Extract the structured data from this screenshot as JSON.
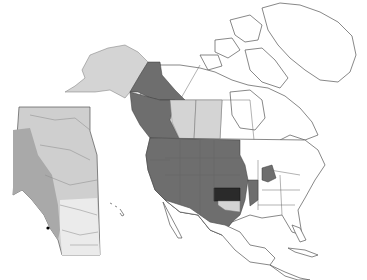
{
  "map": {
    "title": "",
    "region": "North America",
    "legend_colors": {
      "primary_range": "#6e6e6e",
      "secondary_range": "#d4d4d4",
      "focus_area": "#2a2a2a",
      "land": "#ffffff",
      "outline": "#555555"
    },
    "shaded_regions": {
      "primary_range": [
        "British Columbia",
        "Yukon",
        "Washington",
        "Oregon",
        "California",
        "Idaho",
        "Montana",
        "Wyoming",
        "Nevada",
        "Utah",
        "Colorado",
        "Arizona",
        "New Mexico",
        "North Dakota",
        "South Dakota",
        "Nebraska",
        "Iowa",
        "Missouri",
        "Illinois",
        "Arkansas",
        "Texas",
        "Michigan"
      ],
      "secondary_range": [
        "Alaska",
        "Alberta",
        "Saskatchewan",
        "Oklahoma"
      ],
      "focus_area": [
        "Kansas"
      ]
    },
    "inset": {
      "subject": "Alberta",
      "style": "grayscale relief"
    },
    "caption_text": ""
  }
}
